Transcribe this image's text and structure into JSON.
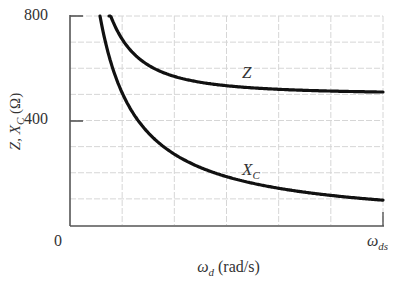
{
  "chart_data": {
    "type": "line",
    "title": "",
    "xlabel": "ω_d (rad/s)",
    "ylabel": "Z, X_C (Ω)",
    "ylim": [
      0,
      800
    ],
    "yticks": [
      0,
      400,
      800
    ],
    "ytick_labels": [
      "0",
      "400",
      "800"
    ],
    "xtick_labels": [
      "0",
      "ω_ds"
    ],
    "grid": true,
    "grid_y_step": 100,
    "grid_x_divisions": 6,
    "x_normalized": [
      0.1,
      0.12,
      0.14,
      0.17,
      0.2,
      0.25,
      0.3,
      0.4,
      0.5,
      0.6,
      0.7,
      0.8,
      0.9,
      1.0
    ],
    "series": [
      {
        "name": "Z",
        "label": "Z",
        "values": [
          null,
          860,
          760,
          680,
          630,
          585,
          560,
          535,
          523,
          516,
          512,
          510,
          508,
          507
        ]
      },
      {
        "name": "X_C",
        "label": "X_C",
        "values": [
          720,
          640,
          565,
          480,
          420,
          345,
          292,
          225,
          182,
          153,
          132,
          116,
          104,
          94
        ]
      }
    ],
    "legend": "inline labels",
    "colors": {
      "curve": "#111111",
      "grid": "#d6d6d6",
      "axis": "#555555"
    }
  },
  "labels": {
    "y_top": "800",
    "y_mid": "400",
    "x_origin": "0",
    "x_end_main": "ω",
    "x_end_sub": "ds",
    "y_axis_main": "Z, X",
    "y_axis_sub": "C",
    "y_axis_unit": " (Ω)",
    "x_axis_main": "ω",
    "x_axis_sub": "d",
    "x_axis_unit": " (rad/s)",
    "curve_z": "Z",
    "curve_xc_main": "X",
    "curve_xc_sub": "C"
  }
}
